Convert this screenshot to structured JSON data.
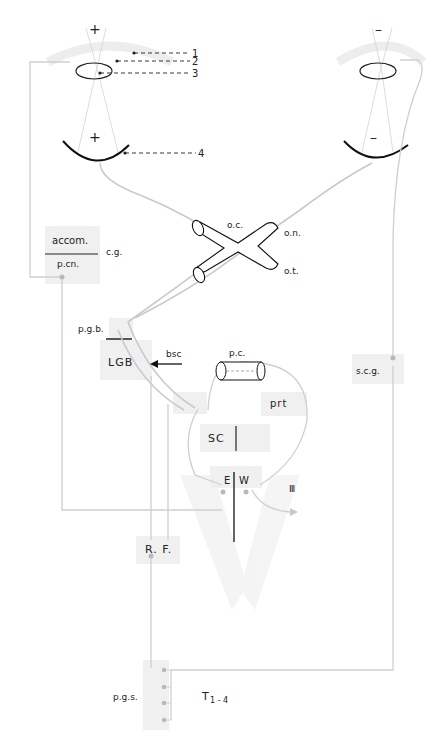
{
  "diagram": {
    "colors": {
      "pathway": "#c9c9c9",
      "box": "#f0f0f0",
      "ink": "#222222",
      "watermark": "#f1f1f1"
    },
    "eyes": {
      "left": {
        "object_sign": "+",
        "retina_sign": "+"
      },
      "right": {
        "object_sign": "–",
        "retina_sign": "–"
      }
    },
    "callouts": [
      "1",
      "2",
      "3",
      "4"
    ],
    "chiasm": {
      "oc": "o.c.",
      "on": "o.n.",
      "ot": "o.t."
    },
    "nuclei": {
      "accom": "accom.",
      "pcn": "p.cn.",
      "cg": "c.g.",
      "pgb": "p.g.b.",
      "lgb": "LGB",
      "bsc": "bsc",
      "pc": "p.c.",
      "prt": "prt",
      "sc": "SC",
      "e": "E",
      "w": "W",
      "cn3": "Ⅲ",
      "rf": "R. F.",
      "scg": "s.c.g.",
      "pgs": "p.g.s.",
      "t14_main": "T",
      "t14_sub": "1 - 4"
    }
  }
}
